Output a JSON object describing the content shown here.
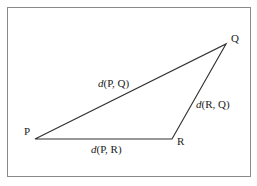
{
  "diagram": {
    "type": "triangle",
    "vertices": [
      {
        "id": "P",
        "label": "P"
      },
      {
        "id": "Q",
        "label": "Q"
      },
      {
        "id": "R",
        "label": "R"
      }
    ],
    "edges": [
      {
        "from": "P",
        "to": "Q",
        "func": "d",
        "args": "(P, Q)"
      },
      {
        "from": "R",
        "to": "Q",
        "func": "d",
        "args": "(R, Q)"
      },
      {
        "from": "P",
        "to": "R",
        "func": "d",
        "args": "(P, R)"
      }
    ],
    "colors": {
      "line": "#333333",
      "frame": "#8a8a8a",
      "text": "#222222"
    }
  }
}
